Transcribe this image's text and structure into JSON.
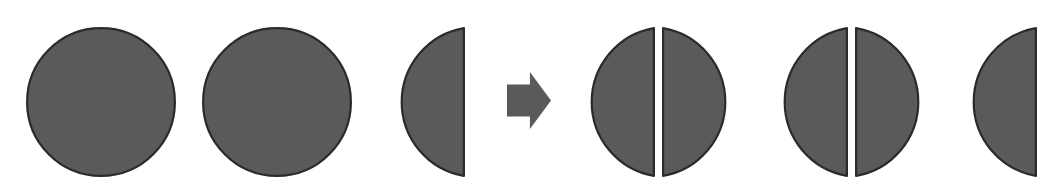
{
  "figure": {
    "canvas": {
      "width": 1051,
      "height": 192,
      "background": "#ffffff"
    },
    "style": {
      "fill_color": "#5a5a5a",
      "outline_color": "#2b2b2b",
      "outline_width": 2.2,
      "gap_color": "#ffffff"
    },
    "geometry": {
      "shape_top": 27,
      "shape_bottom": 177,
      "diameter": 150,
      "radius": 75,
      "center_y": 102
    },
    "left_group": {
      "label": "dividend",
      "value_text": "2 1/2",
      "shapes": [
        {
          "name": "whole-circle",
          "kind": "circle",
          "left": 26,
          "right": 176,
          "center_x": 101,
          "value": 1
        },
        {
          "name": "whole-circle",
          "kind": "circle",
          "left": 202,
          "right": 352,
          "center_x": 277,
          "value": 1
        },
        {
          "name": "half-circle",
          "kind": "semicircle-left-bulge",
          "left": 378,
          "right": 465,
          "flat_edge": "right",
          "value": 0.5
        }
      ]
    },
    "arrow": {
      "name": "right-arrow",
      "direction": "right",
      "left": 507,
      "right": 551,
      "top": 72,
      "bottom": 129,
      "color": "#5a5a5a"
    },
    "right_group": {
      "label": "result",
      "value_text": "5 halves",
      "shapes": [
        {
          "name": "split-circle",
          "kind": "circle-split-vertically",
          "left": 575,
          "right": 740,
          "gap_left": 655,
          "gap_right": 662,
          "halves": 2
        },
        {
          "name": "split-circle",
          "kind": "circle-split-vertically",
          "left": 764,
          "right": 928,
          "gap_left": 848,
          "gap_right": 855,
          "halves": 2
        },
        {
          "name": "half-circle",
          "kind": "semicircle-left-bulge",
          "left": 952,
          "right": 1037,
          "flat_edge": "right",
          "halves": 1
        }
      ],
      "total_halves": 5
    }
  }
}
